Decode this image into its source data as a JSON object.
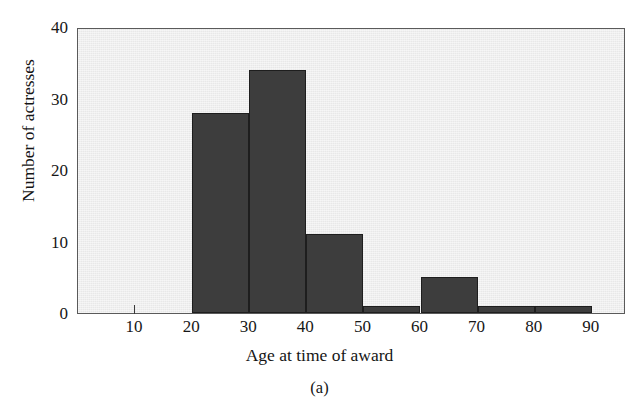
{
  "figure": {
    "title": "",
    "caption": "(a)"
  },
  "chart_data": {
    "type": "bar",
    "title": "",
    "xlabel": "Age at time of award",
    "ylabel": "Number of actresses",
    "xlim": [
      0,
      96
    ],
    "ylim": [
      0,
      40
    ],
    "xticks": [
      10,
      20,
      30,
      40,
      50,
      60,
      70,
      80,
      90
    ],
    "xtick_labels": [
      "10",
      "20",
      "30",
      "40",
      "50",
      "60",
      "70",
      "80",
      "90"
    ],
    "yticks": [
      0,
      10,
      20,
      30,
      40
    ],
    "ytick_labels": [
      "0",
      "10",
      "20",
      "30",
      "40"
    ],
    "grid": false,
    "legend": null,
    "bin_width": 10,
    "bins": [
      {
        "range": "20-30",
        "x0": 20,
        "x1": 30,
        "value": 28
      },
      {
        "range": "30-40",
        "x0": 30,
        "x1": 40,
        "value": 34
      },
      {
        "range": "40-50",
        "x0": 40,
        "x1": 50,
        "value": 11
      },
      {
        "range": "50-60",
        "x0": 50,
        "x1": 60,
        "value": 1
      },
      {
        "range": "60-70",
        "x0": 60,
        "x1": 70,
        "value": 5
      },
      {
        "range": "70-80",
        "x0": 70,
        "x1": 80,
        "value": 1
      },
      {
        "range": "80-90",
        "x0": 80,
        "x1": 90,
        "value": 1
      }
    ],
    "categories": [
      "20-30",
      "30-40",
      "40-50",
      "50-60",
      "60-70",
      "70-80",
      "80-90"
    ],
    "values": [
      28,
      34,
      11,
      1,
      5,
      1,
      1
    ],
    "colors": {
      "bar_fill": "#3d3d3d",
      "bar_edge": "#1e1e1e",
      "plot_background": "#e8e8e8",
      "frame": "#5a5a5a",
      "text": "#171717",
      "page_background": "#ffffff"
    }
  }
}
